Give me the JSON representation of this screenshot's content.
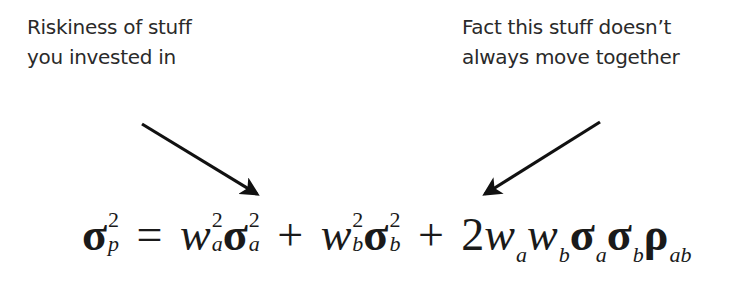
{
  "annotations": {
    "left": {
      "lines": [
        "Riskiness of stuff",
        "you invested in"
      ],
      "arrow": {
        "from": [
          142,
          124
        ],
        "to": [
          258,
          196
        ],
        "direction": "down-right"
      }
    },
    "right": {
      "lines": [
        "Fact this stuff doesn’t",
        "always move together"
      ],
      "arrow": {
        "from": [
          600,
          122
        ],
        "to": [
          484,
          196
        ],
        "direction": "down-left"
      }
    }
  },
  "formula": {
    "lhs": {
      "symbol": "σ",
      "sup": "2",
      "sub": "p"
    },
    "equals": "=",
    "terms": [
      {
        "w": "w",
        "w_sup": "2",
        "w_sub": "a",
        "s": "σ",
        "s_sup": "2",
        "s_sub": "a"
      },
      {
        "op": "+"
      },
      {
        "w": "w",
        "w_sup": "2",
        "w_sub": "b",
        "s": "σ",
        "s_sup": "2",
        "s_sub": "b"
      },
      {
        "op": "+"
      },
      {
        "coef": "2",
        "w1": "w",
        "w1_sub": "a",
        "w2": "w",
        "w2_sub": "b",
        "s1": "σ",
        "s1_sub": "a",
        "s2": "σ",
        "s2_sub": "b",
        "rho": "ρ",
        "rho_sub": "ab"
      }
    ],
    "plain_text": "σ_p^2 = w_a^2 σ_a^2 + w_b^2 σ_b^2 + 2 w_a w_b σ_a σ_b ρ_ab"
  },
  "colors": {
    "text": "#2a2a2a",
    "arrow": "#111111",
    "background": "#ffffff"
  }
}
